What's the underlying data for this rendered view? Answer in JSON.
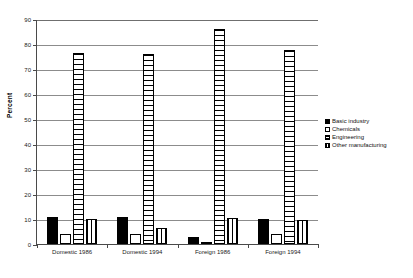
{
  "chart_data": {
    "type": "bar",
    "title": "",
    "subtitle": "",
    "xlabel": "",
    "ylabel": "Percent",
    "ylim": [
      0,
      90
    ],
    "yticks": [
      0,
      10,
      20,
      30,
      40,
      50,
      60,
      70,
      80,
      90
    ],
    "ytick_labels": [
      "0",
      "10",
      "20",
      "30",
      "40",
      "50",
      "60",
      "70",
      "80",
      "90"
    ],
    "grid": true,
    "grid_axis": "y",
    "legend_position": "right",
    "categories": [
      "Domestic 1986",
      "Domestic 1994",
      "Foreign 1986",
      "Foreign 1994"
    ],
    "series": [
      {
        "name": "Basic industry",
        "pattern": "solid-black",
        "color": "#000000",
        "values": [
          11,
          11,
          3,
          10
        ]
      },
      {
        "name": "Chemicals",
        "pattern": "empty-white",
        "color": "#ffffff",
        "values": [
          4,
          4,
          0.5,
          4
        ]
      },
      {
        "name": "Engineering",
        "pattern": "horizontal-hatch",
        "color": "#ffffff",
        "values": [
          76.5,
          76,
          86,
          77.5
        ]
      },
      {
        "name": "Other manufacturing",
        "pattern": "vertical-hatch",
        "color": "#ffffff",
        "values": [
          10,
          6.5,
          10.5,
          9.5
        ]
      }
    ]
  },
  "axis": {
    "y_title": "Percent"
  },
  "legend": {
    "items": [
      {
        "label": "Basic industry"
      },
      {
        "label": "Chemicals"
      },
      {
        "label": "Engineering"
      },
      {
        "label": "Other manufacturing"
      }
    ]
  },
  "colors": {
    "axis": "#4a4a4a",
    "grid": "#8c8c8c",
    "bar_outline": "#000000",
    "background": "#ffffff"
  }
}
